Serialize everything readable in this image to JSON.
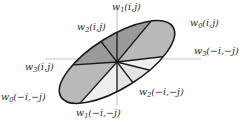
{
  "figure": {
    "kind": "sector-diagram",
    "background": "#ffffff",
    "axis_color": "#c8c8c8",
    "outline_color": "#1a1a1a",
    "shade_dark": "#9a9a9a",
    "shade_mid": "#b9b9b9",
    "shade_light": "#e4e4e4",
    "shade_lighter": "#efefef",
    "center": {
      "x": 117,
      "y": 62
    },
    "axes": {
      "horizontal": {
        "x1": 45,
        "x2": 201,
        "y": 59
      },
      "vertical": {
        "y1": 9,
        "y2": 106,
        "x": 117
      }
    },
    "ellipse": {
      "cx": 117,
      "cy": 62,
      "rx": 66,
      "ry": 26,
      "rotation_deg": -32
    }
  },
  "labels": [
    {
      "id": "w1-ij",
      "base": "w",
      "sub": "1",
      "args": "(i,j)",
      "x": 112,
      "y": 2,
      "anchor": "center"
    },
    {
      "id": "w0-ij",
      "base": "w",
      "sub": "0",
      "args": "(i,j)",
      "x": 190,
      "y": 18,
      "anchor": "left"
    },
    {
      "id": "w2-ij",
      "base": "w",
      "sub": "2",
      "args": "(i,j)",
      "x": 77,
      "y": 22,
      "anchor": "left"
    },
    {
      "id": "w3-mimj",
      "base": "w",
      "sub": "3",
      "args": "(-i,-j)",
      "x": 194,
      "y": 46,
      "anchor": "left"
    },
    {
      "id": "w3-ij",
      "base": "w",
      "sub": "3",
      "args": "(i,j)",
      "x": 25,
      "y": 62,
      "anchor": "left"
    },
    {
      "id": "w2-mimj",
      "base": "w",
      "sub": "2",
      "args": "(-i,-j)",
      "x": 139,
      "y": 87,
      "anchor": "left"
    },
    {
      "id": "w0-mimj",
      "base": "w",
      "sub": "0",
      "args": "(-i,-j)",
      "x": 1,
      "y": 92,
      "anchor": "left"
    },
    {
      "id": "w1-mimj",
      "base": "w",
      "sub": "1",
      "args": "(-i,-j)",
      "x": 76,
      "y": 108,
      "anchor": "left"
    }
  ],
  "sectors": [
    {
      "id": "sector-w2-ij",
      "fill": "#9a9a9a"
    },
    {
      "id": "sector-w1-ij",
      "fill": "#9a9a9a"
    },
    {
      "id": "sector-w0-ij",
      "fill": "#b9b9b9"
    },
    {
      "id": "sector-w3-mimj",
      "fill": "#efefef"
    },
    {
      "id": "sector-w2-mimj",
      "fill": "#e4e4e4"
    },
    {
      "id": "sector-w1-mimj",
      "fill": "#e4e4e4"
    },
    {
      "id": "sector-w0-mimj",
      "fill": "#efefef"
    },
    {
      "id": "sector-w3-ij",
      "fill": "#b9b9b9"
    }
  ]
}
